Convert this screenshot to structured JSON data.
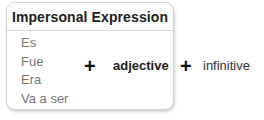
{
  "table": {
    "header": "Impersonal Expression",
    "items": [
      "Es",
      "Fue",
      "Era",
      "Va a ser"
    ]
  },
  "formula": {
    "plus_1": "+",
    "adjective": "adjective",
    "plus_2": "+",
    "infinitive": "infinitive"
  },
  "colors": {
    "border": "#d2d2d2",
    "item_text": "#777777",
    "header_text": "#222222"
  }
}
